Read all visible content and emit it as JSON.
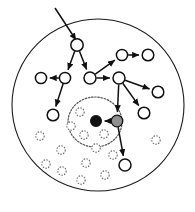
{
  "figure": {
    "width": 195,
    "height": 212,
    "background_color": "#ffffff"
  },
  "colors": {
    "boundary_stroke": "#1a1a1a",
    "edge_stroke": "#111111",
    "open_node_fill": "#ffffff",
    "open_node_stroke": "#111111",
    "filled_node_fill": "#111111",
    "gray_node_fill": "#8f8f8f",
    "dashed_node_stroke": "#6b6b6b",
    "region_stroke": "#555555"
  },
  "boundary": {
    "name": "network-area-boundary",
    "shape": "circle",
    "cx": 98,
    "cy": 105,
    "r": 86,
    "style": "solid"
  },
  "region": {
    "name": "target-region-boundary",
    "shape": "circle",
    "cx": 95,
    "cy": 122,
    "rx": 27,
    "ry": 25,
    "style": "dotted"
  },
  "entry_arrow": {
    "name": "incoming-query-arrow",
    "x1": 55,
    "y1": 8,
    "x2": 76,
    "y2": 40,
    "arrowhead": true
  },
  "nodes": [
    {
      "id": "n1",
      "label": "",
      "x": 77,
      "y": 45,
      "r": 6.2,
      "type": "open"
    },
    {
      "id": "n2",
      "label": "",
      "x": 65,
      "y": 78,
      "r": 5.6,
      "type": "open"
    },
    {
      "id": "n3",
      "label": "",
      "x": 41,
      "y": 78,
      "r": 5.6,
      "type": "open"
    },
    {
      "id": "n4",
      "label": "",
      "x": 53,
      "y": 115,
      "r": 5.8,
      "type": "open"
    },
    {
      "id": "n5",
      "label": "",
      "x": 90,
      "y": 78,
      "r": 6.0,
      "type": "open"
    },
    {
      "id": "n6",
      "label": "",
      "x": 122,
      "y": 55,
      "r": 5.6,
      "type": "open"
    },
    {
      "id": "n7",
      "label": "",
      "x": 148,
      "y": 55,
      "r": 5.8,
      "type": "open"
    },
    {
      "id": "n8",
      "label": "",
      "x": 119,
      "y": 78,
      "r": 6.0,
      "type": "open"
    },
    {
      "id": "n9",
      "label": "",
      "x": 158,
      "y": 92,
      "r": 5.8,
      "type": "open"
    },
    {
      "id": "n10",
      "label": "",
      "x": 144,
      "y": 113,
      "r": 5.8,
      "type": "open"
    },
    {
      "id": "n11",
      "label": "",
      "x": 125,
      "y": 165,
      "r": 6.0,
      "type": "open"
    },
    {
      "id": "n12",
      "label": "",
      "x": 117,
      "y": 121,
      "r": 5.8,
      "type": "gray"
    },
    {
      "id": "n13",
      "label": "",
      "x": 96,
      "y": 121,
      "r": 5.4,
      "type": "filled"
    }
  ],
  "edges": [
    {
      "from": "n1",
      "to": "n2",
      "directed": true
    },
    {
      "from": "n2",
      "to": "n3",
      "directed": true
    },
    {
      "from": "n2",
      "to": "n4",
      "directed": true
    },
    {
      "from": "n1",
      "to": "n5",
      "directed": true
    },
    {
      "from": "n5",
      "to": "n6",
      "directed": true
    },
    {
      "from": "n6",
      "to": "n7",
      "directed": true
    },
    {
      "from": "n5",
      "to": "n8",
      "directed": true
    },
    {
      "from": "n8",
      "to": "n9",
      "directed": true
    },
    {
      "from": "n8",
      "to": "n10",
      "directed": true
    },
    {
      "from": "n8",
      "to": "n12",
      "directed": true
    },
    {
      "from": "n12",
      "to": "n11",
      "directed": true
    },
    {
      "from": "n12",
      "to": "n13",
      "directed": true
    }
  ],
  "inactive_nodes": [
    {
      "id": "d1",
      "x": 80,
      "y": 112,
      "r": 4.2
    },
    {
      "id": "d2",
      "x": 84,
      "y": 135,
      "r": 4.2
    },
    {
      "id": "d3",
      "x": 104,
      "y": 134,
      "r": 4.2
    },
    {
      "id": "d4",
      "x": 96,
      "y": 148,
      "r": 4.2
    },
    {
      "id": "d5",
      "x": 71,
      "y": 126,
      "r": 4.2
    },
    {
      "id": "d6",
      "x": 40,
      "y": 136,
      "r": 4.2
    },
    {
      "id": "d7",
      "x": 61,
      "y": 150,
      "r": 4.2
    },
    {
      "id": "d8",
      "x": 62,
      "y": 171,
      "r": 4.2
    },
    {
      "id": "d9",
      "x": 86,
      "y": 163,
      "r": 4.2
    },
    {
      "id": "d10",
      "x": 81,
      "y": 180,
      "r": 4.2
    },
    {
      "id": "d11",
      "x": 105,
      "y": 175,
      "r": 4.2
    },
    {
      "id": "d12",
      "x": 113,
      "y": 155,
      "r": 4.2
    },
    {
      "id": "d13",
      "x": 156,
      "y": 140,
      "r": 4.2
    },
    {
      "id": "d14",
      "x": 46,
      "y": 164,
      "r": 4.2
    }
  ]
}
